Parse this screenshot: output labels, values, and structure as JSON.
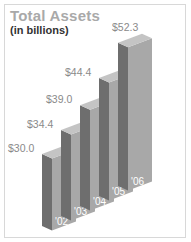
{
  "chart": {
    "title": "Total Assets",
    "subtitle": "(in billions)"
  },
  "chart_data": {
    "type": "bar",
    "title": "Total Assets",
    "subtitle": "(in billions)",
    "categories": [
      "'02",
      "'03",
      "'04",
      "'05",
      "'06"
    ],
    "values": [
      30.0,
      34.4,
      39.0,
      44.4,
      52.3
    ],
    "value_labels": [
      "$30.0",
      "$34.4",
      "$39.0",
      "$44.4",
      "$52.3"
    ],
    "xlabel": "",
    "ylabel": "",
    "grid": false,
    "legend": null,
    "style": "3d-isometric-bars",
    "colors": {
      "front": "#a8a8a8",
      "side": "#6e6e6e",
      "top": "#c4c4c4"
    }
  }
}
